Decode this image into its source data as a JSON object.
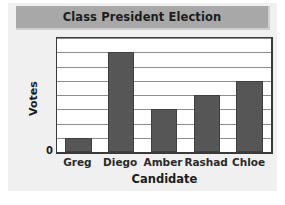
{
  "chart_data": {
    "type": "bar",
    "title": "Class President Election",
    "xlabel": "Candidate",
    "ylabel": "Votes",
    "categories": [
      "Greg",
      "Diego",
      "Amber",
      "Rashad",
      "Chloe"
    ],
    "values": [
      1,
      7,
      3,
      4,
      5
    ],
    "ylim": [
      0,
      8
    ],
    "y_tick_labels": [
      "0"
    ],
    "y_tick_values": [
      0
    ],
    "gridlines": true,
    "gridline_count": 8,
    "legend": null,
    "legend_position": "none",
    "annotations": [],
    "colors": {
      "bar_fill": "#565656",
      "bar_edge": "#3f3f3f",
      "plot_background": "#ffffff",
      "plot_border": "#3a3a3a",
      "gridline": "#8d8d8d",
      "title_band": "#a8a8a8",
      "card_background": "#f0f0f0",
      "text": "#1c1c1c"
    }
  }
}
